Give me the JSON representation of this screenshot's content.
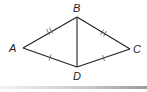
{
  "diagram": {
    "type": "geometry-figure",
    "points": {
      "A": {
        "label": "A",
        "x": 23,
        "y": 48
      },
      "B": {
        "label": "B",
        "x": 77,
        "y": 17
      },
      "C": {
        "label": "C",
        "x": 130,
        "y": 49
      },
      "D": {
        "label": "D",
        "x": 77,
        "y": 67
      }
    },
    "segments": [
      {
        "from": "A",
        "to": "B",
        "ticks": 2
      },
      {
        "from": "B",
        "to": "C",
        "ticks": 2
      },
      {
        "from": "A",
        "to": "D",
        "ticks": 1
      },
      {
        "from": "D",
        "to": "C",
        "ticks": 1
      },
      {
        "from": "B",
        "to": "D",
        "ticks": 0
      }
    ],
    "colors": {
      "line": "#222222",
      "background": "#ffffff"
    }
  }
}
